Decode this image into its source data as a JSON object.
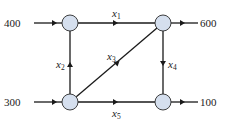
{
  "diagram": {
    "type": "flow-network",
    "colors": {
      "node_fill": "#d5dfee",
      "line": "#1a1a1a",
      "text": "#222222"
    },
    "nodes": [
      {
        "id": "A",
        "position": "top-left"
      },
      {
        "id": "B",
        "position": "top-right"
      },
      {
        "id": "C",
        "position": "bottom-left"
      },
      {
        "id": "D",
        "position": "bottom-right"
      }
    ],
    "external_flows": {
      "in_top_left": "400",
      "in_bottom_left": "300",
      "out_top_right": "600",
      "out_bottom_right": "100"
    },
    "edges": [
      {
        "var": "x",
        "sub": "1",
        "from": "A",
        "to": "B"
      },
      {
        "var": "x",
        "sub": "2",
        "from": "C",
        "to": "A"
      },
      {
        "var": "x",
        "sub": "3",
        "from": "C",
        "to": "B"
      },
      {
        "var": "x",
        "sub": "4",
        "from": "B",
        "to": "D"
      },
      {
        "var": "x",
        "sub": "5",
        "from": "C",
        "to": "D"
      }
    ]
  }
}
